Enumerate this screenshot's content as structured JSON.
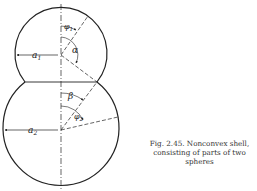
{
  "figure": {
    "labels": {
      "a1": "a",
      "a1_sub": "1",
      "a2": "a",
      "a2_sub": "2",
      "phi1": "φ",
      "phi1_sub": "1",
      "phi2": "φ",
      "phi2_sub": "2",
      "alpha": "α",
      "beta": "β"
    },
    "colors": {
      "stroke": "#222222",
      "background": "#ffffff"
    }
  },
  "caption": {
    "line1": "Fig. 2.45. Nonconvex shell,",
    "line2": "consisting of parts of two",
    "line3": "spheres"
  }
}
